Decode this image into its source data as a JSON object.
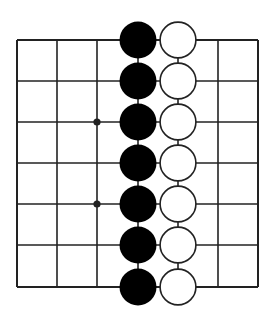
{
  "diagram": {
    "type": "go-board-fragment",
    "background": "#ffffff",
    "line_color": "#222222",
    "grid": {
      "columns": 7,
      "rows": 7,
      "x_lines": [
        17,
        57,
        97,
        138,
        178,
        218,
        258
      ],
      "y_lines": [
        40,
        81,
        122,
        163,
        204,
        245,
        287
      ]
    },
    "star_points": [
      {
        "col": 2,
        "row": 2
      },
      {
        "col": 2,
        "row": 4
      }
    ],
    "stones": [
      {
        "color": "black",
        "col": 3,
        "row": 0
      },
      {
        "color": "black",
        "col": 3,
        "row": 1
      },
      {
        "color": "black",
        "col": 3,
        "row": 2
      },
      {
        "color": "black",
        "col": 3,
        "row": 3
      },
      {
        "color": "black",
        "col": 3,
        "row": 4
      },
      {
        "color": "black",
        "col": 3,
        "row": 5
      },
      {
        "color": "black",
        "col": 3,
        "row": 6
      },
      {
        "color": "white",
        "col": 4,
        "row": 0
      },
      {
        "color": "white",
        "col": 4,
        "row": 1
      },
      {
        "color": "white",
        "col": 4,
        "row": 2
      },
      {
        "color": "white",
        "col": 4,
        "row": 3
      },
      {
        "color": "white",
        "col": 4,
        "row": 4
      },
      {
        "color": "white",
        "col": 4,
        "row": 5
      },
      {
        "color": "white",
        "col": 4,
        "row": 6
      }
    ],
    "stone_colors": {
      "black": "#000000",
      "white": "#ffffff",
      "white_outline": "#222222"
    }
  }
}
